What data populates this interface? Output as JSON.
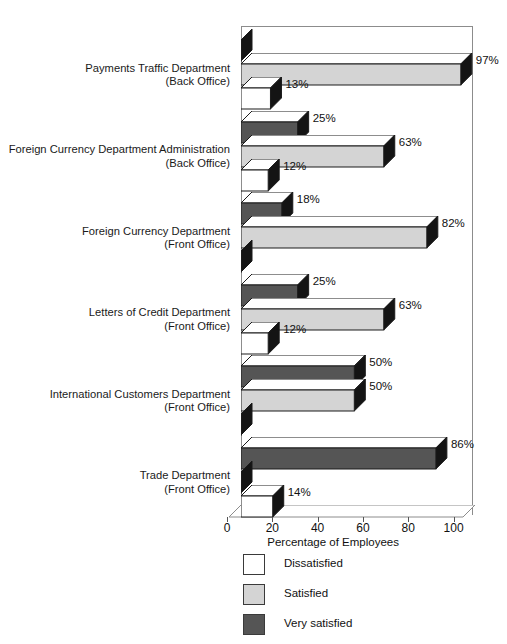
{
  "chart_data": {
    "type": "bar",
    "orientation": "horizontal",
    "title": "",
    "xlabel": "Percentage of Employees",
    "ylabel": "",
    "xlim": [
      0,
      100
    ],
    "xticks": [
      0,
      20,
      40,
      60,
      80,
      100
    ],
    "grid": false,
    "legend_position": "bottom-left",
    "categories": [
      "Payments Traffic Department (Back Office)",
      "Foreign Currency Department Administration (Back Office)",
      "Foreign Currency Department (Front Office)",
      "Letters of Credit Department (Front Office)",
      "International Customers Department (Front Office)",
      "Trade Department (Front Office)"
    ],
    "series": [
      {
        "name": "Very satisfied",
        "color": "#555555",
        "values": [
          0,
          25,
          18,
          25,
          50,
          86
        ]
      },
      {
        "name": "Satisfied",
        "color": "#d4d4d4",
        "values": [
          97,
          63,
          82,
          63,
          50,
          0
        ]
      },
      {
        "name": "Dissatisfied",
        "color": "#ffffff",
        "values": [
          13,
          12,
          0,
          12,
          0,
          14
        ]
      }
    ]
  },
  "axis": {
    "title": "Percentage of Employees",
    "ticks": [
      "0",
      "20",
      "40",
      "60",
      "80",
      "100"
    ]
  },
  "legend": {
    "items": [
      {
        "label": "Dissatisfied",
        "swatch": "white"
      },
      {
        "label": "Satisfied",
        "swatch": "light-gray"
      },
      {
        "label": "Very satisfied",
        "swatch": "dark-gray"
      }
    ]
  },
  "groups": [
    {
      "line1": "Payments Traffic Department",
      "line2": "(Back Office)",
      "bars": [
        {
          "series": "Very satisfied",
          "value": 0,
          "label": ""
        },
        {
          "series": "Satisfied",
          "value": 97,
          "label": "97%"
        },
        {
          "series": "Dissatisfied",
          "value": 13,
          "label": "13%"
        }
      ]
    },
    {
      "line1": "Foreign Currency Department Administration",
      "line2": "(Back Office)",
      "bars": [
        {
          "series": "Very satisfied",
          "value": 25,
          "label": "25%"
        },
        {
          "series": "Satisfied",
          "value": 63,
          "label": "63%"
        },
        {
          "series": "Dissatisfied",
          "value": 12,
          "label": "12%"
        }
      ]
    },
    {
      "line1": "Foreign Currency Department",
      "line2": "(Front Office)",
      "bars": [
        {
          "series": "Very satisfied",
          "value": 18,
          "label": "18%"
        },
        {
          "series": "Satisfied",
          "value": 82,
          "label": "82%"
        },
        {
          "series": "Dissatisfied",
          "value": 0,
          "label": ""
        }
      ]
    },
    {
      "line1": "Letters of Credit Department",
      "line2": "(Front Office)",
      "bars": [
        {
          "series": "Very satisfied",
          "value": 25,
          "label": "25%"
        },
        {
          "series": "Satisfied",
          "value": 63,
          "label": "63%"
        },
        {
          "series": "Dissatisfied",
          "value": 12,
          "label": "12%"
        }
      ]
    },
    {
      "line1": "International Customers Department",
      "line2": "(Front Office)",
      "bars": [
        {
          "series": "Very satisfied",
          "value": 50,
          "label": "50%"
        },
        {
          "series": "Satisfied",
          "value": 50,
          "label": "50%"
        },
        {
          "series": "Dissatisfied",
          "value": 0,
          "label": ""
        }
      ]
    },
    {
      "line1": "Trade Department",
      "line2": "(Front Office)",
      "bars": [
        {
          "series": "Very satisfied",
          "value": 86,
          "label": "86%"
        },
        {
          "series": "Satisfied",
          "value": 0,
          "label": ""
        },
        {
          "series": "Dissatisfied",
          "value": 14,
          "label": "14%"
        }
      ]
    }
  ],
  "colors": {
    "dissatisfied": "#ffffff",
    "satisfied": "#d4d4d4",
    "very_satisfied": "#555555",
    "bar_outline": "#1a1a1a",
    "bar_side": "#141414",
    "frame": "#8c8c8c",
    "text": "#111111"
  }
}
